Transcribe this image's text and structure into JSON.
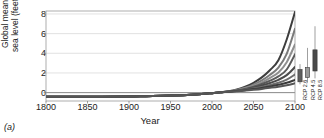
{
  "figure": {
    "panel_label": "(a)"
  },
  "chart_data": {
    "type": "line",
    "title": "",
    "xlabel": "Year",
    "ylabel": "Global mean sea level (feet)",
    "xlim": [
      1800,
      2100
    ],
    "ylim": [
      -0.85,
      8.3
    ],
    "xticks": [
      1800,
      1850,
      1900,
      1950,
      2000,
      2050,
      2100
    ],
    "yticks": [
      0,
      2,
      4,
      6,
      8
    ],
    "grid": true,
    "grid_axis": "y",
    "legend": "none",
    "x": [
      1800,
      1850,
      1900,
      1920,
      1950,
      1980,
      2000,
      2010,
      2020,
      2030,
      2040,
      2050,
      2060,
      2070,
      2080,
      2090,
      2100
    ],
    "series": [
      {
        "name": "Extreme",
        "color": "#3d3d3d",
        "width": 2.0,
        "values": [
          -0.42,
          -0.42,
          -0.4,
          -0.36,
          -0.3,
          -0.18,
          -0.05,
          0.03,
          0.14,
          0.32,
          0.6,
          1.0,
          1.55,
          2.3,
          3.3,
          5.4,
          8.2
        ]
      },
      {
        "name": "High",
        "color": "#7a7a7a",
        "width": 2.0,
        "values": [
          -0.42,
          -0.42,
          -0.4,
          -0.36,
          -0.3,
          -0.18,
          -0.05,
          0.03,
          0.13,
          0.28,
          0.5,
          0.82,
          1.25,
          1.82,
          2.55,
          3.95,
          6.5
        ]
      },
      {
        "name": "Intermediate-High",
        "color": "#8f8f8f",
        "width": 2.0,
        "values": [
          -0.42,
          -0.42,
          -0.4,
          -0.36,
          -0.3,
          -0.18,
          -0.05,
          0.03,
          0.12,
          0.25,
          0.44,
          0.7,
          1.05,
          1.5,
          2.05,
          3.1,
          4.9
        ]
      },
      {
        "name": "Intermediate",
        "color": "#5a5a5a",
        "width": 2.0,
        "values": [
          -0.42,
          -0.42,
          -0.4,
          -0.36,
          -0.3,
          -0.18,
          -0.05,
          0.03,
          0.11,
          0.22,
          0.38,
          0.6,
          0.88,
          1.22,
          1.65,
          2.35,
          3.9
        ]
      },
      {
        "name": "Intermediate-Low",
        "color": "#4a4a4a",
        "width": 2.0,
        "values": [
          -0.42,
          -0.42,
          -0.4,
          -0.36,
          -0.3,
          -0.18,
          -0.05,
          0.03,
          0.1,
          0.2,
          0.33,
          0.5,
          0.72,
          0.98,
          1.3,
          1.78,
          2.6
        ]
      },
      {
        "name": "Low-Mid",
        "color": "#6d6d6d",
        "width": 2.0,
        "values": [
          -0.42,
          -0.42,
          -0.4,
          -0.36,
          -0.3,
          -0.18,
          -0.05,
          0.03,
          0.1,
          0.18,
          0.29,
          0.42,
          0.58,
          0.78,
          1.0,
          1.32,
          1.85
        ]
      },
      {
        "name": "Low",
        "color": "#3a3a3a",
        "width": 2.0,
        "values": [
          -0.42,
          -0.42,
          -0.4,
          -0.36,
          -0.3,
          -0.18,
          -0.05,
          0.03,
          0.09,
          0.16,
          0.25,
          0.36,
          0.48,
          0.63,
          0.8,
          1.0,
          1.3
        ]
      },
      {
        "name": "Lowest",
        "color": "#555555",
        "width": 2.0,
        "values": [
          -0.42,
          -0.42,
          -0.4,
          -0.36,
          -0.3,
          -0.18,
          -0.05,
          0.03,
          0.08,
          0.14,
          0.21,
          0.29,
          0.38,
          0.49,
          0.61,
          0.76,
          0.95
        ]
      }
    ],
    "boxplots": [
      {
        "label": "RCP 2.6",
        "whisker_low": 0.85,
        "box_low": 1.1,
        "box_high": 2.35,
        "whisker_high": 2.9,
        "color": "#5e5e5e"
      },
      {
        "label": "RCP 4.5",
        "whisker_low": 1.0,
        "box_low": 1.55,
        "box_high": 2.55,
        "whisker_high": 4.55,
        "color": "#9a9a9a"
      },
      {
        "label": "RCP 8.5",
        "whisker_low": 1.45,
        "box_low": 2.2,
        "box_high": 4.35,
        "whisker_high": 6.75,
        "color": "#4a4a4a"
      }
    ]
  }
}
